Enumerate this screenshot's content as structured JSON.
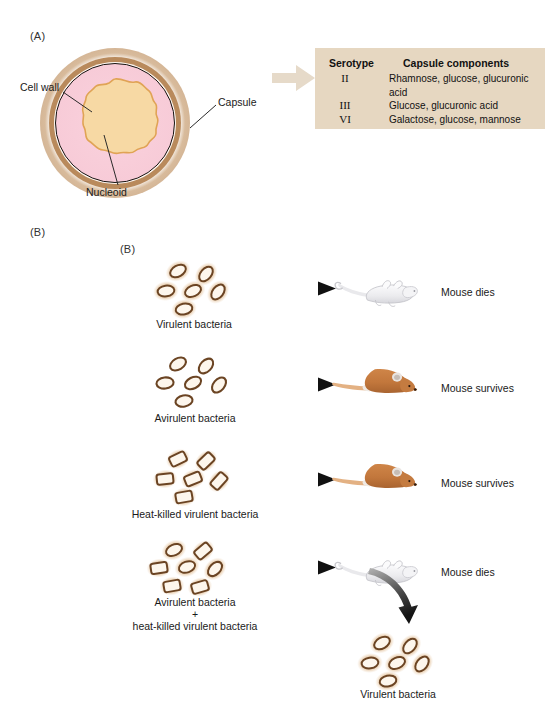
{
  "figure": {
    "panel_a_label": "(A)",
    "panel_b_label": "(B)",
    "panel_b_label_inner": "(B)"
  },
  "panel_a": {
    "cell_labels": {
      "cell_wall": "Cell wall",
      "capsule": "Capsule",
      "nucleoid": "Nucleoid"
    },
    "table": {
      "headers": [
        "Serotype",
        "Capsule components"
      ],
      "rows": [
        {
          "serotype": "II",
          "components": "Rhamnose, glucose, glucuronic acid"
        },
        {
          "serotype": "III",
          "components": "Glucose, glucuronic acid"
        },
        {
          "serotype": "VI",
          "components": "Galactose, glucose, mannose"
        }
      ],
      "background_color": "#e6d7c1"
    }
  },
  "panel_b": {
    "rows": [
      {
        "input_label": "Virulent bacteria",
        "bacteria_type": "encapsulated-oval",
        "outcome": "Mouse dies",
        "mouse_state": "dead"
      },
      {
        "input_label": "Avirulent bacteria",
        "bacteria_type": "plain-oval",
        "outcome": "Mouse survives",
        "mouse_state": "alive"
      },
      {
        "input_label": "Heat-killed virulent bacteria",
        "bacteria_type": "encapsulated-angular",
        "outcome": "Mouse survives",
        "mouse_state": "alive"
      },
      {
        "input_label_line1": "Avirulent bacteria",
        "input_label_line2": "+",
        "input_label_line3": "heat-killed virulent bacteria",
        "bacteria_type": "mixed",
        "outcome": "Mouse dies",
        "mouse_state": "dead",
        "recovered_label": "Virulent bacteria"
      }
    ]
  },
  "colors": {
    "capsule_halo": "#e2c29c",
    "cell_wall": "#b07f4f",
    "cytoplasm": "#f8cdd9",
    "nucleoid": "#f7d9a4",
    "table_bg": "#e6d7c1",
    "arrow_dark": "#1c1c1c",
    "mouse_alive": "#c4783f",
    "mouse_dead": "#e8e8ea",
    "text": "#1a1a1a"
  }
}
